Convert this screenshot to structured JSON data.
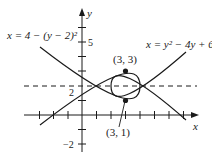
{
  "figure": {
    "type": "diagram",
    "axes": {
      "x_label": "x",
      "y_label": "y",
      "y_tick_labels": {
        "five": "5",
        "two": "2",
        "neg_two": "−2"
      }
    },
    "curves": [
      {
        "id": "left-opening",
        "equation": "x = 4 − (y − 2)²"
      },
      {
        "id": "right-opening",
        "equation": "x = y² − 4y + 6"
      }
    ],
    "points": [
      {
        "label": "(3, 3)",
        "x": 3,
        "y": 3
      },
      {
        "label": "(3, 1)",
        "x": 3,
        "y": 1
      }
    ],
    "dashed_line": {
      "equation": "y = 2"
    },
    "colors": {
      "ink": "#1a1a1a",
      "background": "#ffffff"
    }
  }
}
